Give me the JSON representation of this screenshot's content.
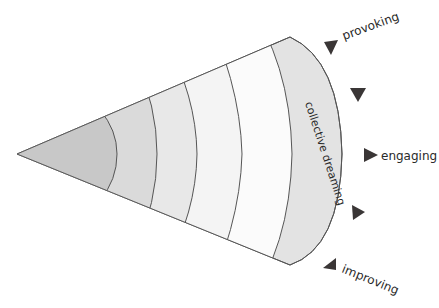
{
  "diagram": {
    "type": "cone-of-layers",
    "band_label": "collective dreaming",
    "layers": [
      {
        "name": "layer-1",
        "fill": "#c9c9c9"
      },
      {
        "name": "layer-2",
        "fill": "#dcdcdc"
      },
      {
        "name": "layer-3",
        "fill": "#ebebeb"
      },
      {
        "name": "layer-4",
        "fill": "#f6f6f6"
      },
      {
        "name": "layer-5",
        "fill": "#fbfbfb"
      },
      {
        "name": "outer-band",
        "fill": "#e3e3e3"
      }
    ],
    "markers": [
      {
        "label": "provoking",
        "direction": "down-left"
      },
      {
        "label": "",
        "direction": "down"
      },
      {
        "label": "engaging",
        "direction": "right"
      },
      {
        "label": "",
        "direction": "right"
      },
      {
        "label": "improving",
        "direction": "up-left"
      }
    ],
    "colors": {
      "stroke": "#555555",
      "marker": "#3a3636",
      "text": "#2a2a2a"
    }
  }
}
